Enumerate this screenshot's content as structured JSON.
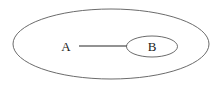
{
  "diagram": {
    "type": "set-membership-ellipse-diagram",
    "background_color": "#ffffff",
    "stroke_color": "#5a5a5a",
    "edge_color": "#6e6e6e",
    "label_color": "#1b1b1b",
    "outer_region": {
      "name": "outer-ellipse",
      "label": "",
      "cx": 111,
      "cy": 44,
      "rx": 98,
      "ry": 35
    },
    "inner_region": {
      "name": "inner-ellipse",
      "label": "B",
      "cx": 152,
      "cy": 46.5,
      "rx": 25.5,
      "ry": 10.5
    },
    "nodes": [
      {
        "id": "A",
        "label": "A",
        "x": 66,
        "y": 46
      },
      {
        "id": "B",
        "label": "B",
        "x": 152,
        "y": 46.5
      }
    ],
    "edges": [
      {
        "from": "A",
        "to": "B",
        "x1": 79,
        "y1": 46,
        "x2": 127,
        "y2": 46
      }
    ]
  }
}
